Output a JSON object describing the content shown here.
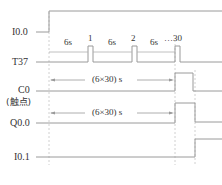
{
  "diagram": {
    "type": "timing-diagram",
    "signals": [
      {
        "id": "i00",
        "label": "I0.0"
      },
      {
        "id": "t37",
        "label": "T37"
      },
      {
        "id": "c0",
        "label": "C0",
        "sublabel": "(触点)"
      },
      {
        "id": "q00",
        "label": "Q0.0"
      },
      {
        "id": "i01",
        "label": "I0.1"
      }
    ],
    "t37_annotations": {
      "interval_1": "6s",
      "pulse_1": "1",
      "interval_2": "6s",
      "pulse_2": "2",
      "interval_3": "6s",
      "ellipsis": "…",
      "pulse_last": "30"
    },
    "c0_span_label": "(6×30) s",
    "q00_span_label": "(6×30) s",
    "colors": {
      "line": "#9a9a9a",
      "dashed": "#b8b8b8",
      "text": "#333333"
    }
  }
}
